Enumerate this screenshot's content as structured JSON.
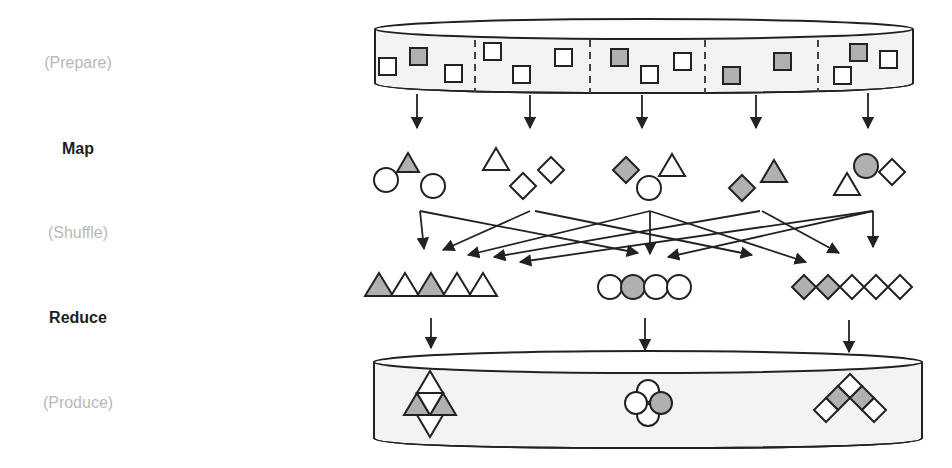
{
  "diagram": {
    "colors": {
      "stroke": "#222222",
      "shaded_fill": "#b0b0b0",
      "empty_fill": "#ffffff",
      "cylinder_body": "#f3f3f3",
      "optional_label": "#b8b8b8",
      "core_label": "#1e1e1e"
    },
    "stages": [
      {
        "id": "prepare",
        "label": "(Prepare)",
        "optional": true
      },
      {
        "id": "map",
        "label": "Map",
        "optional": false
      },
      {
        "id": "shuffle",
        "label": "(Shuffle)",
        "optional": true
      },
      {
        "id": "reduce",
        "label": "Reduce",
        "optional": false
      },
      {
        "id": "produce",
        "label": "(Produce)",
        "optional": true
      }
    ],
    "input_store": {
      "shape": "cylinder",
      "partitions": 5,
      "items_per_partition": [
        [
          "square",
          "square-shaded",
          "square"
        ],
        [
          "square",
          "square",
          "square"
        ],
        [
          "square-shaded",
          "square",
          "square"
        ],
        [
          "square-shaded",
          "square-shaded"
        ],
        [
          "square-shaded",
          "square",
          "square"
        ]
      ]
    },
    "map_outputs": [
      [
        "circle",
        "triangle-shaded",
        "circle"
      ],
      [
        "triangle",
        "diamond",
        "diamond"
      ],
      [
        "diamond-shaded",
        "circle",
        "triangle"
      ],
      [
        "diamond-shaded",
        "triangle-shaded"
      ],
      [
        "triangle",
        "circle-shaded",
        "diamond"
      ]
    ],
    "reduce_groups": [
      {
        "key": "triangle",
        "items": [
          "shaded",
          "empty",
          "shaded",
          "empty",
          "empty"
        ]
      },
      {
        "key": "circle",
        "items": [
          "empty",
          "shaded",
          "empty",
          "empty"
        ]
      },
      {
        "key": "diamond",
        "items": [
          "shaded",
          "shaded",
          "empty",
          "empty",
          "empty"
        ]
      }
    ],
    "output_store": {
      "shape": "cylinder",
      "results": [
        "triangle-cluster",
        "circle-cluster",
        "diamond-cluster"
      ]
    }
  }
}
